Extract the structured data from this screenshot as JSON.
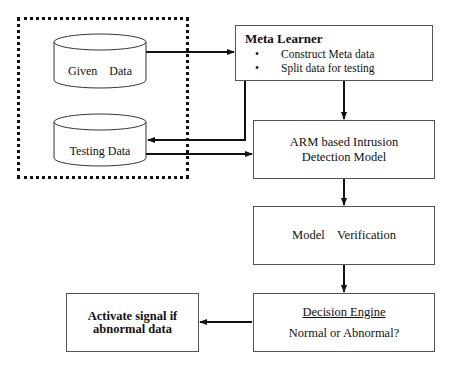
{
  "diagram": {
    "group": {
      "name": "data-store-group",
      "style": "dotted"
    },
    "cylinders": [
      {
        "id": "given",
        "label": "Given    Data"
      },
      {
        "id": "testing",
        "label": "Testing Data"
      }
    ],
    "nodes": {
      "meta_learner": {
        "title": "Meta Learner",
        "bullets": [
          "Construct Meta data",
          "Split data for testing"
        ]
      },
      "arm_model": {
        "line1": "ARM based Intrusion",
        "line2": "Detection Model"
      },
      "verification": {
        "label": "Model    Verification"
      },
      "decision_engine": {
        "title": "Decision Engine",
        "subtitle": "Normal or Abnormal?"
      },
      "activate_signal": {
        "line1": "Activate signal if",
        "line2": "abnormal data"
      }
    },
    "edges": [
      {
        "from": "Given Data",
        "to": "Meta Learner"
      },
      {
        "from": "Meta Learner",
        "to": "Testing Data"
      },
      {
        "from": "Testing Data",
        "to": "ARM based Intrusion Detection Model"
      },
      {
        "from": "Meta Learner",
        "to": "ARM based Intrusion Detection Model"
      },
      {
        "from": "ARM based Intrusion Detection Model",
        "to": "Model Verification"
      },
      {
        "from": "Model Verification",
        "to": "Decision Engine"
      },
      {
        "from": "Decision Engine",
        "to": "Activate signal if abnormal data"
      }
    ],
    "colors": {
      "line": "#111111",
      "box_border": "#555555",
      "background": "#ffffff"
    }
  }
}
